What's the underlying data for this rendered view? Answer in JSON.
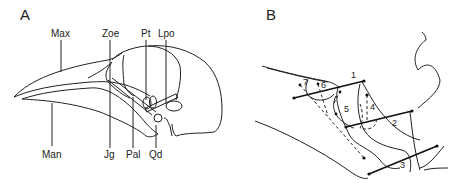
{
  "panels": [
    {
      "id": "A",
      "label": "A",
      "title": "Lateral view of bird skull",
      "annotations": [
        {
          "key": "max",
          "text": "Max"
        },
        {
          "key": "zoe",
          "text": "Zoe"
        },
        {
          "key": "pt",
          "text": "Pt"
        },
        {
          "key": "lpo",
          "text": "Lpo"
        },
        {
          "key": "man",
          "text": "Man"
        },
        {
          "key": "jg",
          "text": "Jg"
        },
        {
          "key": "pal",
          "text": "Pal"
        },
        {
          "key": "qd",
          "text": "Qd"
        }
      ]
    },
    {
      "id": "B",
      "label": "B",
      "title": "Muscle lines of action",
      "muscles": [
        {
          "n": "1",
          "style": "solid"
        },
        {
          "n": "2",
          "style": "solid"
        },
        {
          "n": "3",
          "style": "solid"
        },
        {
          "n": "4",
          "style": "dashed"
        },
        {
          "n": "5",
          "style": "dashed"
        },
        {
          "n": "6",
          "style": "dashed"
        },
        {
          "n": "7",
          "style": "dashed"
        }
      ]
    }
  ],
  "colors": {
    "line": "#222222",
    "background": "#ffffff"
  }
}
